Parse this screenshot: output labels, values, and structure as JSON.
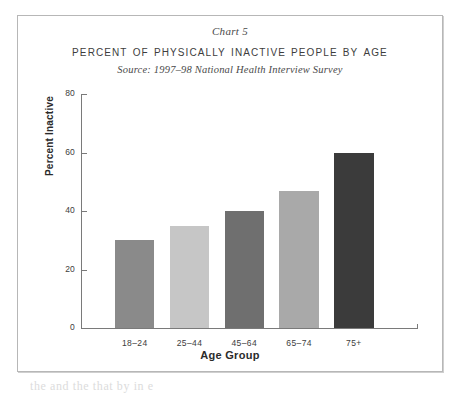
{
  "figure": {
    "chart_number": "Chart 5",
    "title": "Percent of Physically Inactive People by Age",
    "source": "Source: 1997–98 National Health Interview Survey",
    "border_color": "#b7b7b7",
    "background": "#ffffff"
  },
  "axes": {
    "y_title": "Percent Inactive",
    "x_title": "Age Group",
    "y_ticks": [
      "0",
      "20",
      "40",
      "60",
      "80"
    ],
    "axis_color": "#7a7a7a"
  },
  "caption_sliver": "the and the  that  by  in  e",
  "chart_data": {
    "type": "bar",
    "title": "Percent of Physically Inactive People by Age",
    "subtitle": "Chart 5",
    "annotations": [
      "Source: 1997–98 National Health Interview Survey"
    ],
    "xlabel": "Age Group",
    "ylabel": "Percent Inactive",
    "categories": [
      "18–24",
      "25–44",
      "45–64",
      "65–74",
      "75+"
    ],
    "values": [
      30,
      35,
      40,
      47,
      60
    ],
    "bar_colors": [
      "#8a8a8a",
      "#c6c6c6",
      "#6f6f6f",
      "#a9a9a9",
      "#3b3b3b"
    ],
    "ylim": [
      0,
      80
    ],
    "ytick_values": [
      0,
      20,
      40,
      60,
      80
    ],
    "grid": false,
    "legend": "none"
  }
}
